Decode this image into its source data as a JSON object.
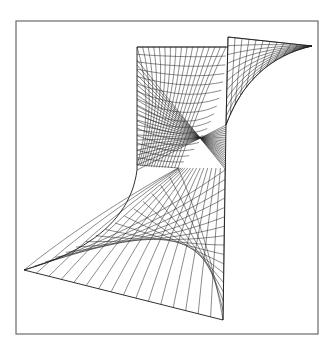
{
  "figure": {
    "colors": {
      "background": "#ffffff",
      "line": "#2a2a2a",
      "frame": "#6a6a6a"
    },
    "frame": {
      "x": 16,
      "y": 21,
      "width": 302,
      "height": 313
    },
    "surface": {
      "center": [
        178,
        168
      ],
      "top_edge": {
        "from": [
          137,
          47
        ],
        "to": [
          228,
          47
        ]
      },
      "flap": {
        "top": [
          228,
          37
        ],
        "tip": [
          312,
          46
        ],
        "join": [
          226,
          125
        ]
      },
      "right_edge": {
        "from": [
          226,
          125
        ],
        "to": [
          223,
          320
        ]
      },
      "left_edge": {
        "from": [
          137,
          47
        ],
        "to": [
          137,
          180
        ]
      },
      "left_tip": [
        24,
        270
      ],
      "bottom_tip": [
        223,
        320
      ],
      "grid_u": 16,
      "grid_v": 16
    }
  }
}
